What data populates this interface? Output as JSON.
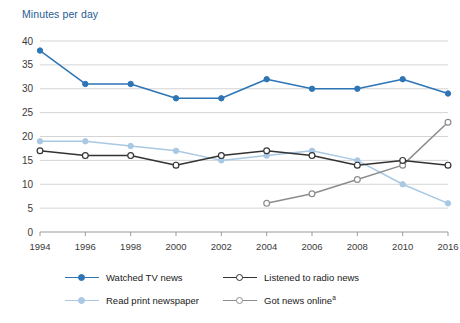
{
  "chart_data": {
    "type": "line",
    "title": "Minutes per day",
    "xlabel": "",
    "ylabel": "Minutes per day",
    "ylim": [
      0,
      40
    ],
    "ytick_step": 5,
    "yticks": [
      0,
      5,
      10,
      15,
      20,
      25,
      30,
      35,
      40
    ],
    "grid": true,
    "legend_position": "bottom",
    "categories": [
      "1994",
      "1996",
      "1998",
      "2000",
      "2002",
      "2004",
      "2006",
      "2008",
      "2010",
      "2016"
    ],
    "series": [
      {
        "name": "Watched TV news",
        "color": "#2e75b6",
        "marker": "filled-circle",
        "values": [
          38,
          31,
          31,
          28,
          28,
          32,
          30,
          30,
          32,
          29
        ]
      },
      {
        "name": "Read print newspaper",
        "color": "#a8c8e4",
        "marker": "filled-circle",
        "values": [
          19,
          19,
          18,
          17,
          15,
          16,
          17,
          15,
          10,
          6
        ]
      },
      {
        "name": "Listened to radio news",
        "color": "#333333",
        "marker": "open-circle",
        "values": [
          17,
          16,
          16,
          14,
          16,
          17,
          16,
          14,
          15,
          14
        ]
      },
      {
        "name": "Got news online",
        "color": "#8c8c8c",
        "marker": "open-circle",
        "note_marker": "a",
        "values": [
          null,
          null,
          null,
          null,
          null,
          6,
          8,
          11,
          14,
          23
        ]
      }
    ]
  },
  "legend": {
    "items": [
      {
        "label": "Watched TV news",
        "note": ""
      },
      {
        "label": "Listened to radio news",
        "note": ""
      },
      {
        "label": "Read print newspaper",
        "note": ""
      },
      {
        "label": "Got news online",
        "note": "a"
      }
    ]
  },
  "colors": {
    "title": "#1f5c93",
    "tv": "#2e75b6",
    "newspaper": "#a8c8e4",
    "radio": "#333333",
    "online": "#8c8c8c",
    "grid": "#d4d4d4",
    "axis": "#9a9a9a"
  }
}
